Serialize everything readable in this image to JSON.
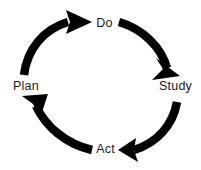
{
  "diagram": {
    "type": "circular-process-cycle",
    "direction": "clockwise",
    "background_color": "#ffffff",
    "arrow_color": "#000000",
    "label_color": "#1b1b1b",
    "center": {
      "x": 100,
      "y": 86
    },
    "radius": 67,
    "stroke_width": 8,
    "stages": [
      {
        "id": "plan",
        "label": "Plan",
        "position": "left",
        "angle_deg": 180,
        "order": 1
      },
      {
        "id": "do",
        "label": "Do",
        "position": "top",
        "angle_deg": 270,
        "order": 2
      },
      {
        "id": "study",
        "label": "Study",
        "position": "right",
        "angle_deg": 0,
        "order": 3
      },
      {
        "id": "act",
        "label": "Act",
        "position": "bottom",
        "angle_deg": 90,
        "order": 4
      }
    ],
    "arrows": [
      {
        "id": "plan-to-do",
        "from": "plan",
        "to": "do",
        "quadrant": "top-left",
        "head_direction": "right"
      },
      {
        "id": "do-to-study",
        "from": "do",
        "to": "study",
        "quadrant": "top-right",
        "head_direction": "down-right"
      },
      {
        "id": "study-to-act",
        "from": "study",
        "to": "act",
        "quadrant": "bottom-right",
        "head_direction": "left"
      },
      {
        "id": "act-to-plan",
        "from": "act",
        "to": "plan",
        "quadrant": "bottom-left",
        "head_direction": "up-left"
      }
    ]
  }
}
